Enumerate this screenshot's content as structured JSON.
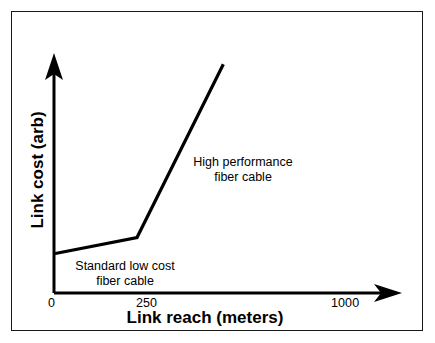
{
  "figure": {
    "background_color": "#ffffff",
    "line_color": "#000000",
    "border_color": "#1a1a1a"
  },
  "axes": {
    "x_title": "Link reach (meters)",
    "y_title": "Link cost (arb)",
    "x_ticks": [
      {
        "label": "0",
        "value": 0
      },
      {
        "label": "250",
        "value": 250
      },
      {
        "label": "1000",
        "value": 1000
      }
    ],
    "y_ticks": []
  },
  "annotations": [
    {
      "name": "high-performance",
      "line1": "High performance",
      "line2": "fiber cable"
    },
    {
      "name": "standard-low-cost",
      "line1": "Standard low cost",
      "line2": "fiber cable"
    }
  ],
  "chart_data": {
    "type": "line",
    "title": "",
    "subtitle": "",
    "xlabel": "Link reach (meters)",
    "ylabel": "Link cost (arb)",
    "xlim": [
      0,
      1000
    ],
    "ylim": [
      0,
      100
    ],
    "grid": false,
    "legend": "none",
    "x_tick_labels": [
      "0",
      "250",
      "1000"
    ],
    "x_tick_values": [
      0,
      250,
      1000
    ],
    "y_tick_labels": [],
    "axis_arrows": {
      "x": "right",
      "y": "up"
    },
    "series": [
      {
        "name": "Link cost versus link reach",
        "color": "#000000",
        "x": [
          0,
          250,
          510
        ],
        "y": [
          17,
          24,
          99
        ],
        "annotations": [
          {
            "text": "Standard low cost fiber cable",
            "segment": "0 to 250",
            "x": 205,
            "y": 9
          },
          {
            "text": "High performance fiber cable",
            "segment": "250 to 510",
            "x": 545,
            "y": 54
          }
        ]
      }
    ]
  }
}
